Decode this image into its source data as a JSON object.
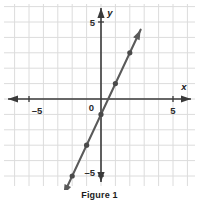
{
  "figure": {
    "caption": "Figure 1"
  },
  "axes": {
    "x_axis_label": "x",
    "y_axis_label": "y",
    "origin_label": "0",
    "x_tick_left": "–5",
    "x_tick_right": "5",
    "y_tick_top": "5",
    "y_tick_bottom": "–5"
  },
  "colors": {
    "grid": "#dcdcdc",
    "axis": "#3a3a3a",
    "line": "#5a5a5a",
    "point": "#4a4a4a",
    "background": "#ffffff",
    "text": "#1b1b1b"
  },
  "chart_data": {
    "type": "line",
    "title": "Figure 1",
    "xlabel": "x",
    "ylabel": "y",
    "xlim": [
      -6,
      6
    ],
    "ylim": [
      -6,
      6
    ],
    "xticks": [
      -5,
      0,
      5
    ],
    "yticks": [
      -5,
      0,
      5
    ],
    "xtick_labels": [
      "–5",
      "0",
      "5"
    ],
    "ytick_labels": [
      "–5",
      "0",
      "5"
    ],
    "grid": true,
    "grid_step": 1,
    "legend": "none",
    "equation": "y = 2x - 1",
    "slope": 2,
    "intercept": -1,
    "series": [
      {
        "name": "line",
        "points": [
          {
            "x": -2,
            "y": -5
          },
          {
            "x": -1,
            "y": -3
          },
          {
            "x": 0,
            "y": -1
          },
          {
            "x": 1,
            "y": 1
          },
          {
            "x": 2,
            "y": 3
          }
        ],
        "extends_with_arrows": true,
        "arrow_start": {
          "x": -2.6,
          "y": -6.2
        },
        "arrow_end": {
          "x": 2.75,
          "y": 4.5
        }
      }
    ]
  }
}
